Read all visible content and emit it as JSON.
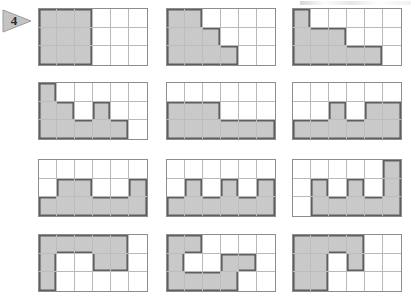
{
  "page": {
    "exercise_number": "4",
    "marker_icon": "triangle-right-marker",
    "background_color": "#ffffff",
    "shade_color": "#c9c9c9",
    "grid_line_color": "#b9b9b9",
    "outline_color": "#5f5f5f",
    "border_color": "#8d8d8d"
  },
  "chart_data": {
    "type": "heatmap",
    "title": "",
    "xlabel": "",
    "ylabel": "",
    "grid_columns": 6,
    "grid_rows": 3,
    "legend": [
      "shaded",
      "unshaded"
    ],
    "note": "Twelve 6x3 grids; each grid's cells are either shaded or blank. Values are 1 = shaded, 0 = blank, listed row by row from top to bottom.",
    "grids": [
      {
        "index": 1,
        "shaded_count": 9,
        "rows": [
          [
            1,
            1,
            1,
            0,
            0,
            0
          ],
          [
            1,
            1,
            1,
            0,
            0,
            0
          ],
          [
            1,
            1,
            1,
            0,
            0,
            0
          ]
        ]
      },
      {
        "index": 2,
        "shaded_count": 9,
        "rows": [
          [
            1,
            1,
            0,
            0,
            0,
            0
          ],
          [
            1,
            1,
            1,
            0,
            0,
            0
          ],
          [
            1,
            1,
            1,
            1,
            0,
            0
          ]
        ]
      },
      {
        "index": 3,
        "shaded_count": 9,
        "rows": [
          [
            1,
            0,
            0,
            0,
            0,
            0
          ],
          [
            1,
            1,
            1,
            0,
            0,
            0
          ],
          [
            1,
            1,
            1,
            1,
            1,
            0
          ]
        ]
      },
      {
        "index": 4,
        "shaded_count": 9,
        "rows": [
          [
            1,
            0,
            0,
            0,
            0,
            0
          ],
          [
            1,
            1,
            0,
            1,
            0,
            0
          ],
          [
            1,
            1,
            1,
            1,
            1,
            0
          ]
        ]
      },
      {
        "index": 5,
        "shaded_count": 9,
        "rows": [
          [
            0,
            0,
            0,
            0,
            0,
            0
          ],
          [
            1,
            1,
            1,
            0,
            0,
            0
          ],
          [
            1,
            1,
            1,
            1,
            1,
            1
          ]
        ]
      },
      {
        "index": 6,
        "shaded_count": 9,
        "rows": [
          [
            0,
            0,
            0,
            0,
            0,
            0
          ],
          [
            0,
            0,
            1,
            0,
            1,
            1
          ],
          [
            1,
            1,
            1,
            1,
            1,
            1
          ]
        ]
      },
      {
        "index": 7,
        "shaded_count": 9,
        "rows": [
          [
            0,
            0,
            0,
            0,
            0,
            0
          ],
          [
            0,
            1,
            1,
            0,
            0,
            1
          ],
          [
            1,
            1,
            1,
            1,
            1,
            1
          ]
        ]
      },
      {
        "index": 8,
        "shaded_count": 9,
        "rows": [
          [
            0,
            0,
            0,
            0,
            0,
            0
          ],
          [
            0,
            1,
            0,
            1,
            0,
            1
          ],
          [
            1,
            1,
            1,
            1,
            1,
            1
          ]
        ]
      },
      {
        "index": 9,
        "shaded_count": 9,
        "rows": [
          [
            0,
            0,
            0,
            0,
            0,
            1
          ],
          [
            0,
            1,
            0,
            1,
            0,
            1
          ],
          [
            0,
            1,
            1,
            1,
            1,
            1
          ]
        ]
      },
      {
        "index": 10,
        "shaded_count": 9,
        "rows": [
          [
            1,
            1,
            1,
            1,
            1,
            0
          ],
          [
            1,
            0,
            0,
            1,
            1,
            0
          ],
          [
            1,
            0,
            0,
            0,
            0,
            0
          ]
        ]
      },
      {
        "index": 11,
        "shaded_count": 10,
        "rows": [
          [
            1,
            1,
            0,
            0,
            0,
            0
          ],
          [
            1,
            0,
            0,
            1,
            1,
            0
          ],
          [
            1,
            1,
            1,
            1,
            0,
            0
          ]
        ]
      },
      {
        "index": 12,
        "shaded_count": 9,
        "rows": [
          [
            1,
            1,
            1,
            1,
            0,
            0
          ],
          [
            1,
            1,
            0,
            1,
            0,
            0
          ],
          [
            1,
            1,
            0,
            0,
            0,
            0
          ]
        ]
      }
    ]
  },
  "layout": {
    "positions": [
      {
        "left": 38,
        "top": 8,
        "width": 110,
        "height": 58
      },
      {
        "left": 166,
        "top": 8,
        "width": 110,
        "height": 58
      },
      {
        "left": 292,
        "top": 8,
        "width": 110,
        "height": 58
      },
      {
        "left": 38,
        "top": 82,
        "width": 110,
        "height": 58
      },
      {
        "left": 166,
        "top": 82,
        "width": 110,
        "height": 58
      },
      {
        "left": 292,
        "top": 82,
        "width": 110,
        "height": 58
      },
      {
        "left": 38,
        "top": 159,
        "width": 110,
        "height": 58
      },
      {
        "left": 166,
        "top": 159,
        "width": 110,
        "height": 58
      },
      {
        "left": 292,
        "top": 159,
        "width": 110,
        "height": 58
      },
      {
        "left": 38,
        "top": 234,
        "width": 110,
        "height": 58
      },
      {
        "left": 166,
        "top": 234,
        "width": 110,
        "height": 58
      },
      {
        "left": 292,
        "top": 234,
        "width": 110,
        "height": 58
      }
    ]
  }
}
